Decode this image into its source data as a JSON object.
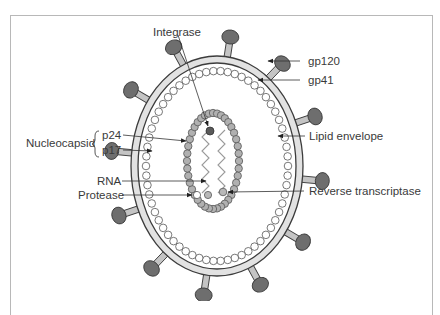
{
  "diagram": {
    "labels": {
      "integrase": "Integrase",
      "gp120": "gp120",
      "gp41": "gp41",
      "lipid_envelope": "Lipid envelope",
      "nucleocapsid": "Nucleocapsid",
      "p24": "p24",
      "p17": "p17",
      "rna": "RNA",
      "protease": "Protease",
      "reverse_transcriptase": "Reverse transcriptase"
    },
    "colors": {
      "spike_head": "#6e6e6e",
      "spike_stalk": "#c4c4c4",
      "envelope_fill": "#e2e2e2",
      "outline": "#3c3c3c",
      "matrix_bead": "#ffffff",
      "capsid_bead": "#b0b0b0",
      "integrase_bead": "#5a5a5a",
      "text": "#3a3a3a",
      "frame": "#b8b8b8"
    },
    "spike_count": 12
  }
}
